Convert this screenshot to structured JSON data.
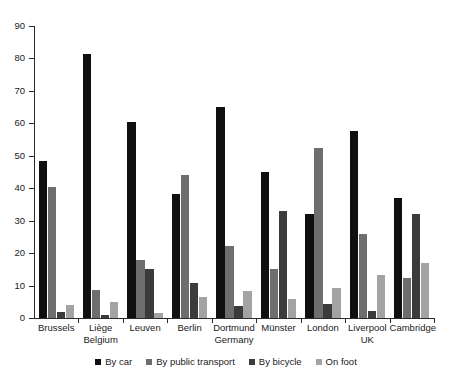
{
  "chart_data": {
    "type": "bar",
    "title": "",
    "subtitle": "",
    "xlabel": "",
    "ylabel": "",
    "ylim": [
      0,
      90
    ],
    "ytick_step": 10,
    "yticks": [
      0,
      10,
      20,
      30,
      40,
      50,
      60,
      70,
      80,
      90
    ],
    "grid": false,
    "legend_position": "bottom",
    "categories": [
      "Brussels",
      "Liège",
      "Leuven",
      "Berlin",
      "Dortmund",
      "Münster",
      "London",
      "Liverpool",
      "Cambridge"
    ],
    "category_sublabels": [
      "",
      "Belgium",
      "",
      "",
      "Germany",
      "",
      "",
      "UK",
      ""
    ],
    "series": [
      {
        "name": "By car",
        "color": "#101010",
        "values": [
          48.5,
          81.5,
          60.3,
          38.2,
          65.0,
          45.0,
          32.0,
          57.5,
          37.0
        ]
      },
      {
        "name": "By public transport",
        "color": "#6e6e6e",
        "values": [
          40.3,
          8.5,
          18.0,
          44.0,
          22.2,
          15.2,
          52.5,
          26.0,
          12.4
        ]
      },
      {
        "name": "By bicycle",
        "color": "#3b3b3b",
        "values": [
          2.0,
          1.0,
          15.2,
          10.8,
          3.7,
          33.0,
          4.3,
          2.1,
          32.0
        ]
      },
      {
        "name": "On foot",
        "color": "#a3a3a3",
        "values": [
          4.0,
          5.0,
          1.7,
          6.5,
          8.2,
          5.8,
          9.3,
          13.3,
          17.0
        ]
      }
    ]
  }
}
